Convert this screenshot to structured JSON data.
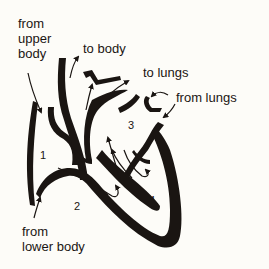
{
  "diagram": {
    "colors": {
      "background": "#fdfcf8",
      "ink": "#1a1512"
    },
    "labels": {
      "from_upper_body_line1": "from",
      "from_upper_body_line2": "upper",
      "from_upper_body_line3": "body",
      "to_body": "to body",
      "to_lungs": "to lungs",
      "from_lungs": "from lungs",
      "from_lower_body_line1": "from",
      "from_lower_body_line2": "lower body"
    },
    "chambers": [
      {
        "number": "1",
        "name": "right atrium"
      },
      {
        "number": "2",
        "name": "right ventricle"
      },
      {
        "number": "3",
        "name": "left atrium"
      },
      {
        "number": "4",
        "name": "left ventricle"
      }
    ]
  }
}
